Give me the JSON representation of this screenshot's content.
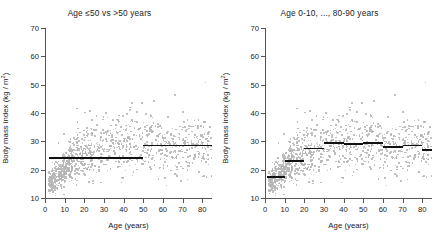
{
  "figure": {
    "background": "#ffffff",
    "point_color": "#b4b4b4",
    "line_color": "#111111",
    "axis_color": "#555555"
  },
  "panels": [
    {
      "id": "left",
      "title": "Age ≤50 vs >50 years",
      "xlabel": "Age (years)",
      "ylabel_text": "Body mass index (kg / m",
      "ylabel_sup": "2",
      "ylabel_close": ")",
      "xticks": [
        "0",
        "10",
        "20",
        "30",
        "40",
        "50",
        "60",
        "70",
        "80"
      ],
      "yticks": [
        "10",
        "20",
        "30",
        "40",
        "50",
        "60",
        "70"
      ]
    },
    {
      "id": "right",
      "title": "Age 0-10, ..., 80-90 years",
      "xlabel": "Age (years)",
      "ylabel_text": "Body mass index (kg / m",
      "ylabel_sup": "2",
      "ylabel_close": ")",
      "xticks": [
        "0",
        "10",
        "20",
        "30",
        "40",
        "50",
        "60",
        "70",
        "80"
      ],
      "yticks": [
        "10",
        "20",
        "30",
        "40",
        "50",
        "60",
        "70"
      ]
    }
  ],
  "chart_data": [
    {
      "type": "scatter",
      "panel": "left",
      "title": "Age ≤50 vs >50 years",
      "xlabel": "Age (years)",
      "ylabel": "Body mass index (kg / m2)",
      "xlim": [
        0,
        85
      ],
      "ylim": [
        10,
        70
      ],
      "grid": false,
      "legend": "none",
      "xticks": [
        0,
        10,
        20,
        30,
        40,
        50,
        60,
        70,
        80
      ],
      "yticks": [
        10,
        20,
        30,
        40,
        50,
        60,
        70
      ],
      "series": [
        {
          "name": "Individuals (Age vs BMI)",
          "marker": "point",
          "color": "#b4b4b4",
          "n_points": 1100
        },
        {
          "name": "Group means (two groups split at 50 years)",
          "type": "step",
          "color": "#111111",
          "segments": [
            {
              "label": "Age ≤ 50 years",
              "x_start": 2,
              "x_end": 50,
              "value": 24.0
            },
            {
              "label": "Age > 50 years",
              "x_start": 50,
              "x_end": 85,
              "value": 28.5
            }
          ]
        }
      ]
    },
    {
      "type": "scatter",
      "panel": "right",
      "title": "Age 0-10, ..., 80-90 years",
      "xlabel": "Age (years)",
      "ylabel": "Body mass index (kg / m2)",
      "xlim": [
        0,
        85
      ],
      "ylim": [
        10,
        70
      ],
      "grid": false,
      "legend": "none",
      "xticks": [
        0,
        10,
        20,
        30,
        40,
        50,
        60,
        70,
        80
      ],
      "yticks": [
        10,
        20,
        30,
        40,
        50,
        60,
        70
      ],
      "series": [
        {
          "name": "Individuals (Age vs BMI)",
          "marker": "point",
          "color": "#b4b4b4",
          "n_points": 1100
        },
        {
          "name": "Decade group means",
          "type": "step",
          "color": "#111111",
          "segments": [
            {
              "label": "0-10",
              "x_start": 1,
              "x_end": 10,
              "value": 17.5
            },
            {
              "label": "10-20",
              "x_start": 10,
              "x_end": 20,
              "value": 23.0
            },
            {
              "label": "20-30",
              "x_start": 20,
              "x_end": 30,
              "value": 27.5
            },
            {
              "label": "30-40",
              "x_start": 30,
              "x_end": 40,
              "value": 29.5
            },
            {
              "label": "40-50",
              "x_start": 40,
              "x_end": 50,
              "value": 29.0
            },
            {
              "label": "50-60",
              "x_start": 50,
              "x_end": 60,
              "value": 29.5
            },
            {
              "label": "60-70",
              "x_start": 60,
              "x_end": 70,
              "value": 28.0
            },
            {
              "label": "70-80",
              "x_start": 70,
              "x_end": 80,
              "value": 28.5
            },
            {
              "label": "80-90",
              "x_start": 80,
              "x_end": 85,
              "value": 27.0
            }
          ]
        }
      ]
    }
  ]
}
